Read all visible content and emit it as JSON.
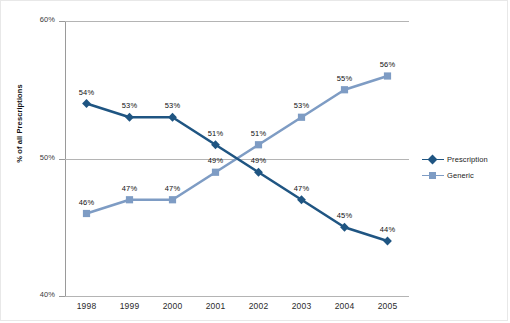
{
  "chart_data": {
    "type": "line",
    "title": "",
    "xlabel": "",
    "ylabel": "% of all Prescriptions",
    "categories": [
      "1998",
      "1999",
      "2000",
      "2001",
      "2002",
      "2003",
      "2004",
      "2005"
    ],
    "ylim": [
      40,
      60
    ],
    "ytick_labels": [
      "40%",
      "50%",
      "60%"
    ],
    "ytick_values": [
      40,
      50,
      60
    ],
    "grid": true,
    "legend_position": "right",
    "series": [
      {
        "name": "Prescription",
        "color": "#1F5582",
        "marker": "diamond",
        "values": [
          54,
          53,
          53,
          51,
          49,
          47,
          45,
          44
        ],
        "labels": [
          "54%",
          "53%",
          "53%",
          "51%",
          "49%",
          "47%",
          "45%",
          "44%"
        ]
      },
      {
        "name": "Generic",
        "color": "#7E9CC4",
        "marker": "square",
        "values": [
          46,
          47,
          47,
          49,
          51,
          53,
          55,
          56
        ],
        "labels": [
          "46%",
          "47%",
          "47%",
          "49%",
          "51%",
          "53%",
          "55%",
          "56%"
        ]
      }
    ]
  },
  "axes": {
    "y_title": "% of all Prescriptions",
    "y_ticks": [
      "60%",
      "50%",
      "40%"
    ],
    "x_ticks": [
      "1998",
      "1999",
      "2000",
      "2001",
      "2002",
      "2003",
      "2004",
      "2005"
    ]
  },
  "legend": {
    "items": [
      {
        "label": "Prescription",
        "color": "#1F5582",
        "marker": "diamond"
      },
      {
        "label": "Generic",
        "color": "#7E9CC4",
        "marker": "square"
      }
    ]
  },
  "colors": {
    "prescription": "#1F5582",
    "generic": "#7E9CC4",
    "gridline": "#b4b4b4",
    "axis": "#9a9a9a",
    "frame": "#e8e8e8"
  }
}
